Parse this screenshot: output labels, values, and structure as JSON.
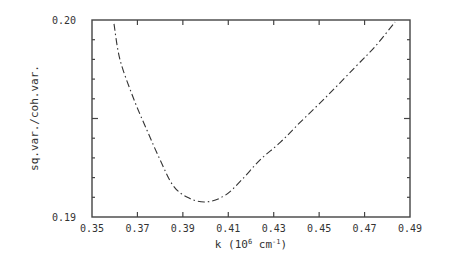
{
  "chart_data": {
    "type": "line",
    "title": "",
    "xlabel": "k (10^6 cm^-1)",
    "xlabel_display": {
      "base": "k (10",
      "sup1": "6",
      "mid": " cm",
      "sup2": "-1",
      "end": ")"
    },
    "ylabel": "sq.var./coh.var.",
    "xlim": [
      0.35,
      0.49
    ],
    "ylim": [
      0.19,
      0.2
    ],
    "grid": false,
    "legend": null,
    "x_ticks": [
      0.35,
      0.37,
      0.39,
      0.41,
      0.43,
      0.45,
      0.47,
      0.49
    ],
    "x_tick_labels": [
      "0.35",
      "0.37",
      "0.39",
      "0.41",
      "0.43",
      "0.45",
      "0.47",
      "0.49"
    ],
    "y_tick_labels": [
      "0.19",
      "0.20"
    ],
    "y_minor_step": 0.001,
    "series": [
      {
        "name": "sq.var./coh.var.",
        "style": "dash-dot",
        "x": [
          0.3597,
          0.3623,
          0.368,
          0.3742,
          0.38,
          0.3857,
          0.392,
          0.4,
          0.4086,
          0.416,
          0.424,
          0.433,
          0.4416,
          0.454,
          0.4658,
          0.475,
          0.4834
        ],
        "y": [
          0.1998,
          0.198,
          0.1961,
          0.1944,
          0.1929,
          0.1916,
          0.191,
          0.19076,
          0.1911,
          0.1919,
          0.1929,
          0.1938,
          0.1948,
          0.1962,
          0.1976,
          0.1987,
          0.1999
        ]
      }
    ]
  }
}
